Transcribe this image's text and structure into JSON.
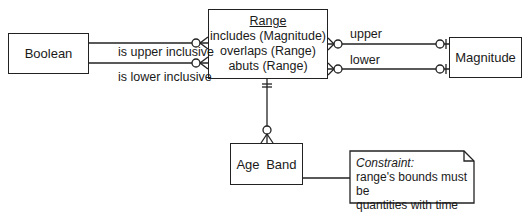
{
  "entities": {
    "boolean": {
      "name": "Boolean"
    },
    "range": {
      "name": "Range",
      "operations": [
        "includes (Magnitude)",
        "overlaps (Range)",
        "abuts (Range)"
      ]
    },
    "magnitude": {
      "name": "Magnitude"
    },
    "age_band": {
      "name": "Age Band"
    }
  },
  "relationships": {
    "is_upper_inclusive": "is upper inclusive",
    "is_lower_inclusive": "is lower inclusive",
    "upper": "upper",
    "lower": "lower"
  },
  "note": {
    "title": "Constraint:",
    "line1": "range's bounds must be",
    "line2": "quantities with time units"
  },
  "colors": {
    "line": "#222222",
    "background": "#ffffff"
  }
}
